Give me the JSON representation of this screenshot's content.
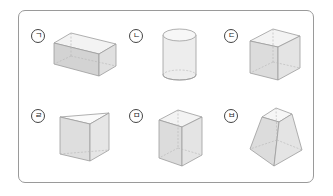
{
  "figure": {
    "items": [
      {
        "label": "ㄱ",
        "shape": "rectangular prism (cuboid, horizontal)"
      },
      {
        "label": "ㄴ",
        "shape": "cylinder"
      },
      {
        "label": "ㄷ",
        "shape": "cube"
      },
      {
        "label": "ㄹ",
        "shape": "triangular prism"
      },
      {
        "label": "ㅁ",
        "shape": "square prism (vertical)"
      },
      {
        "label": "ㅂ",
        "shape": "square frustum (truncated pyramid)"
      }
    ]
  },
  "colors": {
    "border": "#9a9a9a",
    "face_light": "#f2f2f2",
    "face_mid": "#dedede",
    "face_dark": "#cfcfcf",
    "edge": "#9c9c9c",
    "hidden_edge": "#b5b5b5"
  }
}
